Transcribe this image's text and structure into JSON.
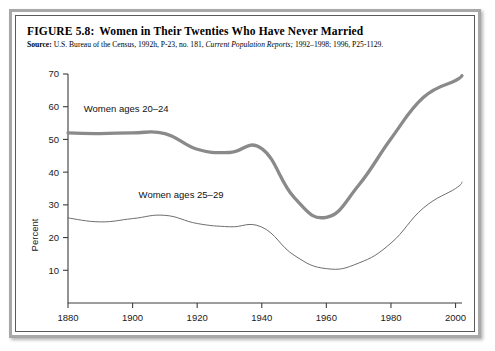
{
  "figure": {
    "number": "FIGURE 5.8:",
    "title": "Women in Their Twenties Who Have Never Married",
    "source_label": "Source:",
    "source_text_1": "U.S. Bureau of the Census, 1992h, P-23, no. 181,",
    "source_italic": "Current Population Reports;",
    "source_text_2": "1992–1998; 1996, P25-1129."
  },
  "chart_data": {
    "type": "line",
    "title": "Women in Their Twenties Who Have Never Married",
    "xlabel": "",
    "ylabel": "Percent",
    "xlim": [
      1880,
      2002
    ],
    "ylim": [
      0,
      70
    ],
    "xticks": [
      1880,
      1900,
      1920,
      1940,
      1960,
      1980,
      2000
    ],
    "yticks": [
      10,
      20,
      30,
      40,
      50,
      60,
      70
    ],
    "xtick_labels": [
      "1880",
      "1900",
      "1920",
      "1940",
      "1960",
      "1980",
      "2000"
    ],
    "ytick_labels": [
      "10",
      "20",
      "30",
      "40",
      "50",
      "60",
      "70"
    ],
    "grid": false,
    "legend": "inline-annotations",
    "series": [
      {
        "name": "Women ages 20–24",
        "label": "Women ages 20–24",
        "style": "thick-gray",
        "color": "#8a8a8a",
        "x": [
          1880,
          1890,
          1900,
          1910,
          1920,
          1930,
          1940,
          1950,
          1960,
          1970,
          1980,
          1990,
          2000,
          2002
        ],
        "values": [
          52.0,
          51.8,
          52.0,
          51.8,
          47.0,
          46.0,
          47.2,
          32.3,
          26.2,
          36.0,
          50.2,
          62.8,
          68.0,
          69.5
        ]
      },
      {
        "name": "Women ages 25–29",
        "label": "Women ages 25–29",
        "style": "thin-gray",
        "color": "#6e6e6e",
        "x": [
          1880,
          1890,
          1900,
          1910,
          1920,
          1930,
          1940,
          1950,
          1960,
          1970,
          1980,
          1990,
          2000,
          2002
        ],
        "values": [
          26.0,
          24.8,
          25.8,
          26.8,
          24.3,
          23.3,
          23.2,
          14.6,
          10.5,
          12.2,
          18.3,
          29.0,
          35.0,
          37.0
        ]
      }
    ],
    "annotations": [
      {
        "text": "Women ages 20–24",
        "x": 1898,
        "y": 58.5
      },
      {
        "text": "Women ages 25–29",
        "x": 1915,
        "y": 32.0
      }
    ]
  }
}
